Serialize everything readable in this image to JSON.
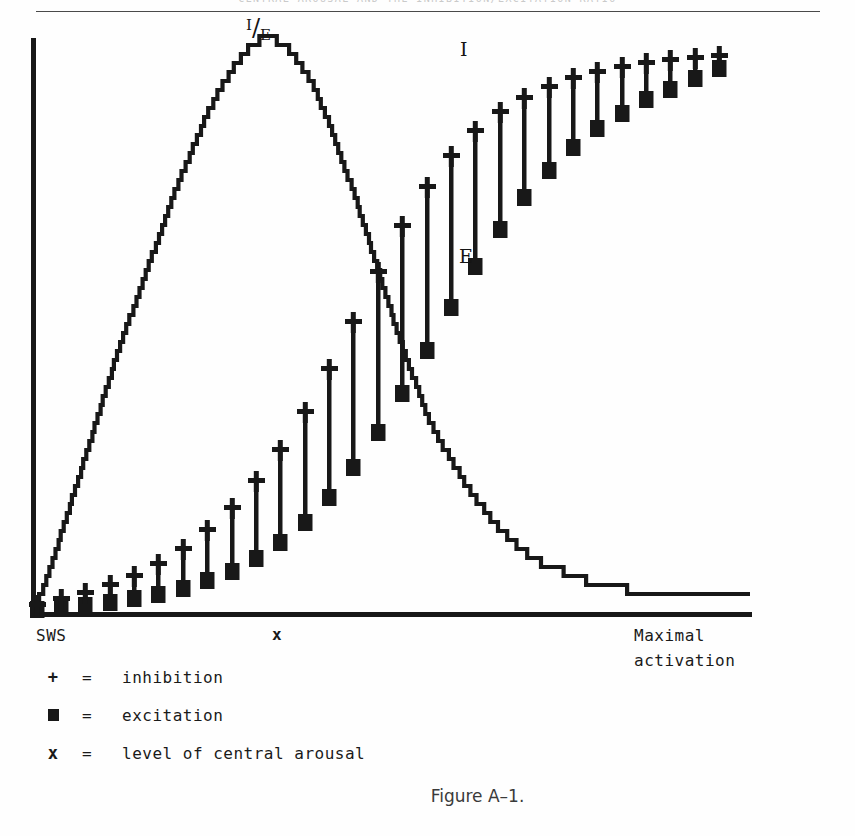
{
  "page": {
    "running_header": "CENTRAL AROUSAL AND THE INHIBITION/EXCITATION RATIO",
    "figure_caption": "Figure A–1."
  },
  "plot_labels": {
    "ratio_numerator": "I",
    "ratio_slash": "/",
    "ratio_denominator": "E",
    "inhibition_curve": "I",
    "excitation_curve": "E"
  },
  "axis": {
    "left_caption": "SWS",
    "mid_caption": "x",
    "right_caption_line1": "Maximal",
    "right_caption_line2": "activation"
  },
  "legend": {
    "rows": [
      {
        "key": "+",
        "key_type": "plus",
        "eq": "=",
        "text": "inhibition"
      },
      {
        "key": "■",
        "key_type": "square",
        "eq": "=",
        "text": "excitation"
      },
      {
        "key": "x",
        "key_type": "letter",
        "eq": "=",
        "text": "level of central arousal"
      }
    ]
  },
  "style": {
    "ink": "#181818",
    "paper": "#fefefe",
    "rule": "#4a4a4a"
  },
  "chart_data": {
    "type": "line",
    "title": "Figure A–1.",
    "xlabel": "level of central arousal",
    "ylabel": "",
    "xlim": [
      0,
      1
    ],
    "ylim": [
      0,
      1
    ],
    "grid": false,
    "legend_position": "below-plot",
    "axes_pixels": {
      "x_origin": 33,
      "x_end": 750,
      "y_top": 38,
      "y_baseline": 612
    },
    "annotations": [
      {
        "text": "I/E",
        "x_px": 268,
        "y_px": 28
      },
      {
        "text": "I",
        "x_px": 466,
        "y_px": 52
      },
      {
        "text": "E",
        "x_px": 465,
        "y_px": 258
      }
    ],
    "series": [
      {
        "name": "I/E ratio",
        "marker": "none",
        "style": "stepped-line",
        "comment": "bell-shaped ratio curve, peaks near level x then decays",
        "x": [
          0.0,
          0.02,
          0.04,
          0.06,
          0.08,
          0.1,
          0.12,
          0.14,
          0.16,
          0.18,
          0.2,
          0.22,
          0.24,
          0.26,
          0.28,
          0.3,
          0.32,
          0.33,
          0.35,
          0.37,
          0.39,
          0.41,
          0.43,
          0.45,
          0.47,
          0.49,
          0.51,
          0.53,
          0.55,
          0.58,
          0.61,
          0.64,
          0.67,
          0.7,
          0.74,
          0.78,
          0.82,
          0.86,
          0.9,
          0.95,
          1.0
        ],
        "y": [
          0.0,
          0.06,
          0.14,
          0.22,
          0.3,
          0.38,
          0.46,
          0.53,
          0.6,
          0.67,
          0.74,
          0.8,
          0.86,
          0.91,
          0.95,
          0.98,
          1.0,
          1.0,
          0.99,
          0.96,
          0.92,
          0.86,
          0.79,
          0.72,
          0.64,
          0.56,
          0.48,
          0.41,
          0.34,
          0.27,
          0.21,
          0.16,
          0.12,
          0.09,
          0.07,
          0.05,
          0.04,
          0.035,
          0.03,
          0.03,
          0.03
        ]
      },
      {
        "name": "inhibition",
        "marker": "plus",
        "style": "markers",
        "comment": "I curve: rises steeply then saturates near top",
        "x": [
          0.005,
          0.039,
          0.073,
          0.107,
          0.141,
          0.175,
          0.209,
          0.243,
          0.277,
          0.311,
          0.345,
          0.379,
          0.413,
          0.447,
          0.481,
          0.515,
          0.549,
          0.583,
          0.617,
          0.651,
          0.685,
          0.719,
          0.753,
          0.787,
          0.821,
          0.855,
          0.889,
          0.923,
          0.957
        ],
        "y": [
          0.012,
          0.022,
          0.033,
          0.047,
          0.063,
          0.084,
          0.11,
          0.142,
          0.181,
          0.228,
          0.283,
          0.348,
          0.423,
          0.506,
          0.592,
          0.672,
          0.74,
          0.795,
          0.838,
          0.871,
          0.896,
          0.915,
          0.93,
          0.941,
          0.95,
          0.957,
          0.962,
          0.966,
          0.969
        ]
      },
      {
        "name": "excitation",
        "marker": "square",
        "style": "markers",
        "comment": "E curve: rises more slowly, converges with I at right",
        "x": [
          0.005,
          0.039,
          0.073,
          0.107,
          0.141,
          0.175,
          0.209,
          0.243,
          0.277,
          0.311,
          0.345,
          0.379,
          0.413,
          0.447,
          0.481,
          0.515,
          0.549,
          0.583,
          0.617,
          0.651,
          0.685,
          0.719,
          0.753,
          0.787,
          0.821,
          0.855,
          0.889,
          0.923,
          0.957
        ],
        "y": [
          0.005,
          0.009,
          0.013,
          0.018,
          0.024,
          0.032,
          0.042,
          0.055,
          0.072,
          0.094,
          0.122,
          0.157,
          0.2,
          0.252,
          0.313,
          0.382,
          0.456,
          0.531,
          0.602,
          0.667,
          0.723,
          0.77,
          0.81,
          0.843,
          0.87,
          0.893,
          0.912,
          0.93,
          0.948
        ]
      }
    ]
  }
}
